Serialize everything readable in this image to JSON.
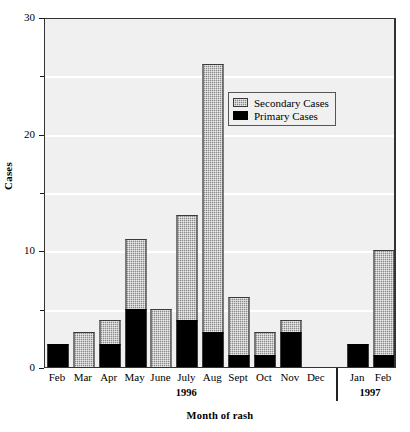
{
  "chart_data": {
    "type": "bar",
    "title": "",
    "subtitle": "",
    "xlabel": "Month of rash",
    "ylabel": "Cases",
    "ylim": [
      0,
      30
    ],
    "yticks": [
      0,
      10,
      20,
      30
    ],
    "yticks_minor": [
      5,
      15,
      25
    ],
    "grid": true,
    "grid_axis": "y",
    "stacked": true,
    "legend_position": "top-right-inside",
    "categories": [
      "Feb",
      "Mar",
      "Apr",
      "May",
      "June",
      "July",
      "Aug",
      "Sept",
      "Oct",
      "Nov",
      "Dec",
      "Jan",
      "Feb"
    ],
    "group_labels": [
      "1996",
      "1997"
    ],
    "group_spans": [
      {
        "label": "1996",
        "start": "Feb",
        "end": "Dec"
      },
      {
        "label": "1997",
        "start": "Jan",
        "end": "Feb"
      }
    ],
    "series": [
      {
        "name": "Primary Cases",
        "color": "#000000",
        "values": [
          2,
          0,
          2,
          5,
          0,
          4,
          3,
          1,
          1,
          3,
          0,
          2,
          1
        ]
      },
      {
        "name": "Secondary Cases",
        "color": "#8a8a8a",
        "values": [
          0,
          3,
          2,
          6,
          5,
          9,
          23,
          5,
          2,
          1,
          0,
          0,
          9
        ]
      }
    ],
    "totals": [
      2,
      3,
      4,
      11,
      5,
      13,
      26,
      6,
      3,
      4,
      0,
      2,
      10
    ]
  },
  "legend": {
    "entries": [
      {
        "label": "Secondary Cases",
        "swatch": "secondary"
      },
      {
        "label": "Primary Cases",
        "swatch": "primary"
      }
    ]
  },
  "axes": {
    "y_label": "Cases",
    "x_label": "Month of rash",
    "y_tick_labels": [
      "0",
      "10",
      "20",
      "30"
    ]
  },
  "colors": {
    "plot_background": "#f0f0f0",
    "gridline": "#ffffff",
    "axis": "#333333",
    "primary": "#000000",
    "secondary": "#8a8a8a",
    "page_background": "#ffffff"
  }
}
